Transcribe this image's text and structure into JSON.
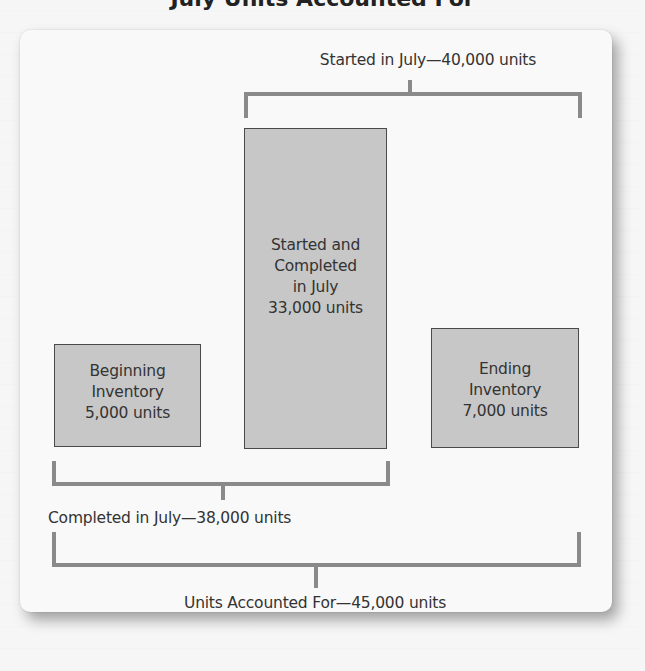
{
  "title": "July Units Accounted For",
  "top_bracket": {
    "label": "Started in July—40,000 units"
  },
  "boxes": {
    "beginning": {
      "line1": "Beginning",
      "line2": "Inventory",
      "line3": "5,000 units"
    },
    "started_completed": {
      "line1": "Started and",
      "line2": "Completed",
      "line3": "in July",
      "line4": "33,000 units"
    },
    "ending": {
      "line1": "Ending",
      "line2": "Inventory",
      "line3": "7,000 units"
    }
  },
  "completed_bracket": {
    "label": "Completed in July—38,000 units"
  },
  "total_bracket": {
    "label": "Units Accounted For—45,000 units"
  },
  "colors": {
    "box_fill": "#c7c7c7",
    "box_border": "#4a4a4a",
    "bracket": "#8a8a8a",
    "card": "#f9f9f9"
  }
}
